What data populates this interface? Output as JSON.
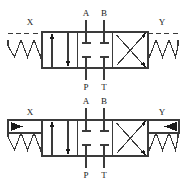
{
  "figure": {
    "type": "hydraulic-directional-control-valve-symbols",
    "diagram_count": 2,
    "line_color": "#3a3a3a",
    "fill_color": "#1a1a1a",
    "background": "#ffffff"
  },
  "diagrams": [
    {
      "id": "top-valve",
      "name": "spring-centered-pilot-operated-valve",
      "left_pilot": {
        "label": "X",
        "actuator": "spring",
        "signal_line": "dashed",
        "has_triangle": false
      },
      "right_pilot": {
        "label": "Y",
        "actuator": "spring",
        "signal_line": "dashed",
        "has_triangle": false
      },
      "ports": {
        "top": [
          {
            "label": "A"
          },
          {
            "label": "B"
          }
        ],
        "bottom": [
          {
            "label": "P"
          },
          {
            "label": "T"
          }
        ]
      },
      "positions": [
        {
          "index": 0,
          "name": "left-parallel-position",
          "flow": "parallel-arrows"
        },
        {
          "index": 1,
          "name": "center-closed-position",
          "flow": "all-ports-blocked"
        },
        {
          "index": 2,
          "name": "right-crossed-position",
          "flow": "crossed-arrows"
        }
      ]
    },
    {
      "id": "bottom-valve",
      "name": "spring-centered-pilot-operated-valve-with-pilot-pressure",
      "left_pilot": {
        "label": "X",
        "actuator": "spring",
        "signal_line": "solid",
        "has_triangle": true,
        "triangle_direction": "right"
      },
      "right_pilot": {
        "label": "Y",
        "actuator": "spring",
        "signal_line": "solid",
        "has_triangle": true,
        "triangle_direction": "left"
      },
      "ports": {
        "top": [
          {
            "label": "A"
          },
          {
            "label": "B"
          }
        ],
        "bottom": [
          {
            "label": "P"
          },
          {
            "label": "T"
          }
        ]
      },
      "positions": [
        {
          "index": 0,
          "name": "left-parallel-position",
          "flow": "parallel-arrows"
        },
        {
          "index": 1,
          "name": "center-closed-position",
          "flow": "all-ports-blocked"
        },
        {
          "index": 2,
          "name": "right-crossed-position",
          "flow": "crossed-arrows"
        }
      ]
    }
  ]
}
